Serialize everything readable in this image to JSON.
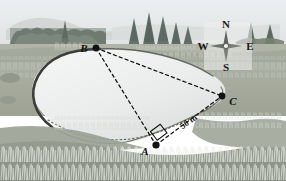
{
  "figure": {
    "kind": "geometry-survey-illustration",
    "description_scene": "Photograph of a pond in a grassy field with conifer trees on the far shore, overlaid with a surveying triangle",
    "points": [
      {
        "id": "A",
        "label": "A",
        "x": 156,
        "y": 145,
        "label_x": 145,
        "label_y": 152,
        "marker": "filled-dot"
      },
      {
        "id": "B",
        "label": "B",
        "x": 96,
        "y": 48,
        "label_x": 83,
        "label_y": 51,
        "marker": "filled-dot"
      },
      {
        "id": "C",
        "label": "C",
        "x": 222,
        "y": 96,
        "label_x": 230,
        "label_y": 104,
        "marker": "filled-dot"
      }
    ],
    "segments": [
      {
        "id": "AB",
        "from": "B",
        "to": "A",
        "style": "dashed"
      },
      {
        "id": "BC",
        "from": "B",
        "to": "C",
        "style": "dashed"
      },
      {
        "id": "AC",
        "from": "A",
        "to": "C",
        "style": "dashed"
      }
    ],
    "measurements": [
      {
        "id": "AC-length",
        "text": "50 m",
        "x": 190,
        "y": 124,
        "rotation": -24
      }
    ],
    "angle_markers": [
      {
        "id": "right-angle-at-A",
        "vertex": "A",
        "type": "right-angle-square"
      }
    ],
    "compass": {
      "north": "N",
      "south": "S",
      "east": "E",
      "west": "W",
      "center_x": 226,
      "center_y": 46
    }
  },
  "colors": {
    "sky": "#e9ecee",
    "distant_hill": "#b9bfbd",
    "far_treeline": "#7f8a80",
    "mid_field": "#a9ada0",
    "near_field": "#9fa497",
    "foreground_bank": "#8e9488",
    "pond_water": "#eceeee",
    "pond_rim_dark": "#3c3f3c",
    "ink": "#111111",
    "grass_blade": "#e8ebe4"
  }
}
